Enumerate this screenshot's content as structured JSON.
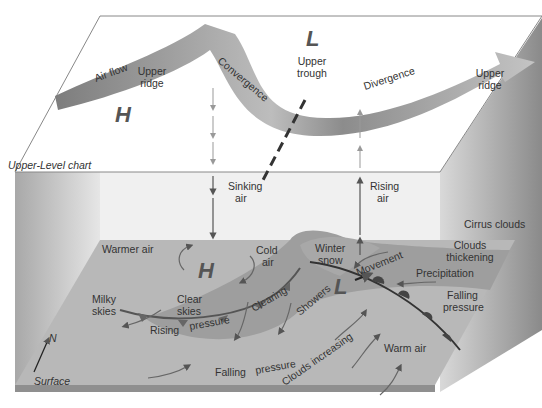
{
  "upper": {
    "chart_label": "Upper-Level chart",
    "air_flow": "Air flow",
    "upper_ridge_left": [
      "Upper",
      "ridge"
    ],
    "convergence": "Convergence",
    "high": "H",
    "low": "L",
    "upper_trough": [
      "Upper",
      "trough"
    ],
    "divergence": "Divergence",
    "upper_ridge_right": [
      "Upper",
      "ridge"
    ]
  },
  "middle": {
    "sinking_air": [
      "Sinking",
      "air"
    ],
    "rising_air": [
      "Rising",
      "air"
    ],
    "cirrus_clouds": "Cirrus clouds"
  },
  "surface": {
    "label": "Surface",
    "north": "N",
    "warmer_air": "Warmer air",
    "high": "H",
    "cold_air": [
      "Cold",
      "air"
    ],
    "milky_skies": [
      "Milky",
      "skies"
    ],
    "clear_skies": [
      "Clear",
      "skies"
    ],
    "rising_pressure": [
      "Rising",
      "pressure"
    ],
    "clearing": "Clearing",
    "showers": "Showers",
    "winter_snow": [
      "Winter",
      "snow"
    ],
    "low": "L",
    "movement": "Movement",
    "clouds_thickening": [
      "Clouds",
      "thickening"
    ],
    "precipitation": "Precipitation",
    "falling_pressure_right": [
      "Falling",
      "pressure"
    ],
    "falling_pressure_bottom": [
      "Falling",
      "pressure"
    ],
    "clouds_increasing": "Clouds increasing",
    "warm_air": "Warm air"
  }
}
